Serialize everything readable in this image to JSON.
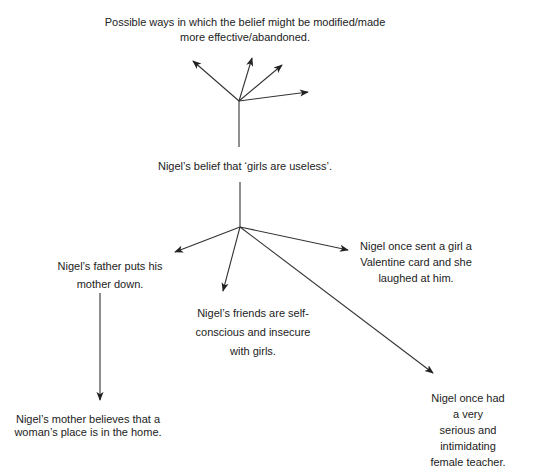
{
  "diagram": {
    "top_label": "Possible ways in which the belief might be modified/made\nmore effective/abandoned.",
    "central_belief": "Nigel’s belief that ‘girls are useless’.",
    "causes": [
      {
        "id": "father",
        "text": "Nigel’s father puts his\nmother down."
      },
      {
        "id": "friends",
        "text": "Nigel’s friends are self-\nconscious and insecure\nwith girls."
      },
      {
        "id": "valentine",
        "text": "Nigel once sent a girl a\nValentine card and she\nlaughed at him."
      },
      {
        "id": "teacher",
        "text": "Nigel once had a very\nserious and intimidating\nfemale teacher."
      }
    ],
    "secondary_causes": [
      {
        "id": "mother",
        "parent": "father",
        "text": "Nigel’s mother believes that a\nwoman’s place is in the home."
      }
    ],
    "edges": [
      {
        "from": "central_belief",
        "to": "top_label",
        "type": "line"
      },
      {
        "from": "top_hub",
        "to": "future_1",
        "type": "arrow"
      },
      {
        "from": "top_hub",
        "to": "future_2",
        "type": "arrow"
      },
      {
        "from": "top_hub",
        "to": "future_3",
        "type": "arrow"
      },
      {
        "from": "top_hub",
        "to": "future_4",
        "type": "arrow"
      },
      {
        "from": "central_belief",
        "to": "father",
        "type": "arrow"
      },
      {
        "from": "central_belief",
        "to": "friends",
        "type": "arrow"
      },
      {
        "from": "central_belief",
        "to": "valentine",
        "type": "arrow"
      },
      {
        "from": "central_belief",
        "to": "teacher",
        "type": "arrow"
      },
      {
        "from": "father",
        "to": "mother",
        "type": "arrow"
      }
    ],
    "line_color": "#333333",
    "text_color": "#222222"
  }
}
